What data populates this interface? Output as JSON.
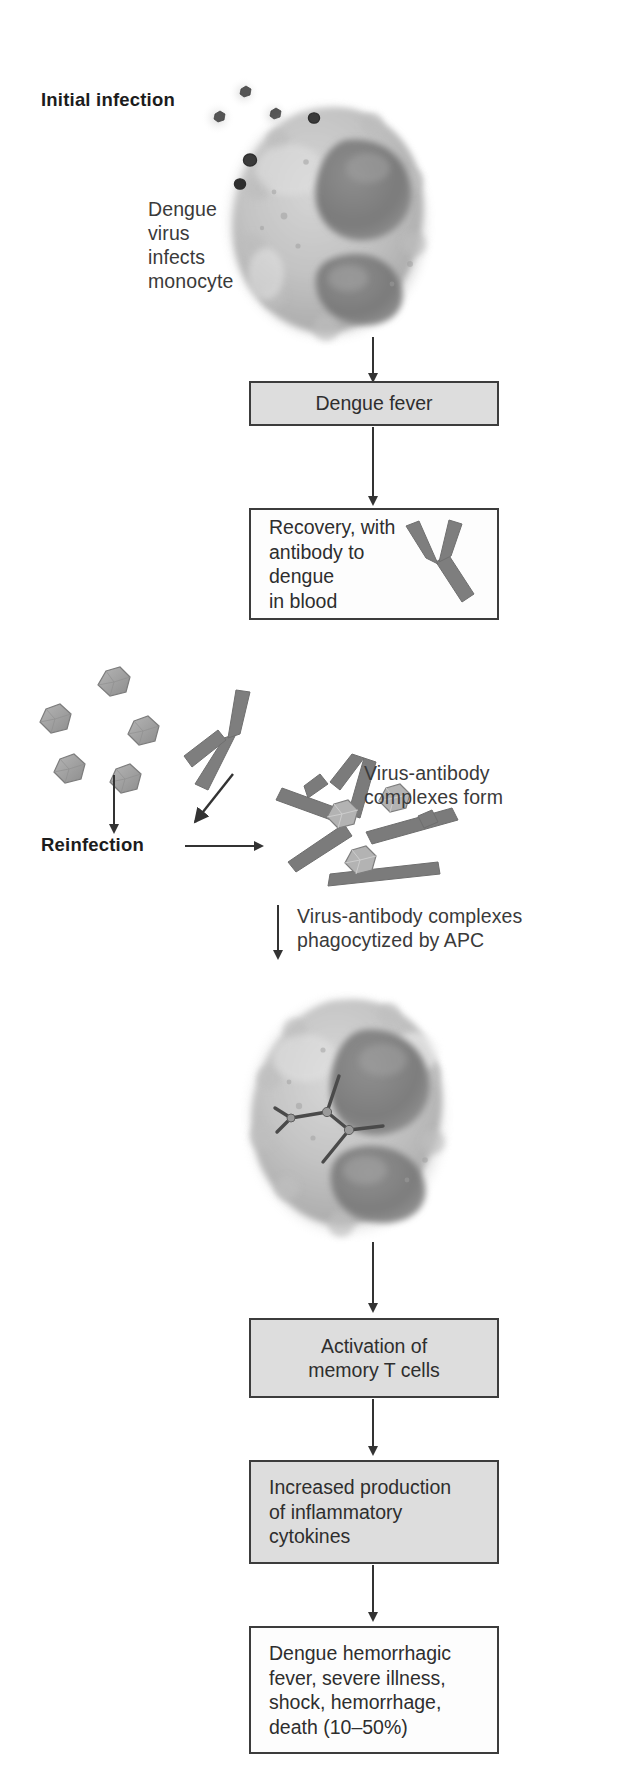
{
  "figure": {
    "title_initial": "Initial infection",
    "title_reinfection": "Reinfection"
  },
  "labels": {
    "virus_infects": "Dengue\nvirus\ninfects\nmonocyte",
    "complexes_form": "Virus-antibody\ncomplexes form",
    "phagocytized": "Virus-antibody complexes\nphagocytized by APC"
  },
  "boxes": {
    "dengue_fever": "Dengue fever",
    "recovery": "Recovery, with\nantibody to\ndengue\nin blood",
    "activation": "Activation of\nmemory T cells",
    "cytokines": "Increased production\nof inflammatory\ncytokines",
    "dhf": "Dengue hemorrhagic\nfever, severe illness,\nshock, hemorrhage,\ndeath (10–50%)"
  },
  "graphics": {
    "monocyte": "monocyte-cell",
    "apc": "apc-cell",
    "free_virions": "dengue-virions",
    "free_antibody": "antibody-y-shape",
    "complex_lattice": "virus-antibody-complex-lattice",
    "internal_complex": "internalized-virus-antibody-complex",
    "recovery_antibody": "antibody-in-blood"
  },
  "colors": {
    "box_fill_gray": "#dddddd",
    "box_fill_white": "#fdfdfd",
    "box_border": "#3c3c3c",
    "arrow": "#333333",
    "antibody": "#7b7b7b",
    "virion": "#9b9b9b",
    "text": "#3a3a3a"
  }
}
